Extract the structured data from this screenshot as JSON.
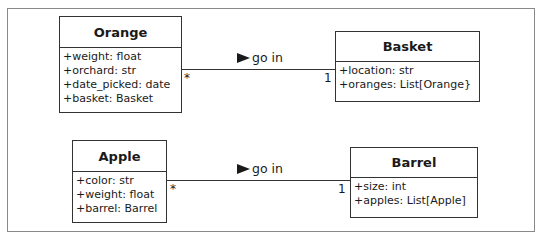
{
  "diagram": {
    "classes": [
      {
        "name": "Orange",
        "attributes": [
          "+weight: float",
          "+orchard: str",
          "+date_picked: date",
          "+basket: Basket"
        ]
      },
      {
        "name": "Basket",
        "attributes": [
          "+location: str",
          "+oranges: List[Orange}"
        ]
      },
      {
        "name": "Apple",
        "attributes": [
          "+color: str",
          "+weight: float",
          "+barrel: Barrel"
        ]
      },
      {
        "name": "Barrel",
        "attributes": [
          "+size: int",
          "+apples: List[Apple]"
        ]
      }
    ],
    "associations": [
      {
        "from": "Orange",
        "to": "Basket",
        "label": "go in",
        "from_mult": "*",
        "to_mult": "1"
      },
      {
        "from": "Apple",
        "to": "Barrel",
        "label": "go in",
        "from_mult": "*",
        "to_mult": "1"
      }
    ]
  }
}
